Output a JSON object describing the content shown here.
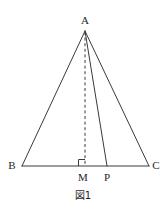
{
  "figure": {
    "caption": "図1",
    "background_color": "#ffffff",
    "stroke_color": "#3a3a3a",
    "label_color": "#1f1f1f",
    "width": 166,
    "height": 208,
    "points": {
      "A": {
        "label": "A",
        "x": 85,
        "y": 31,
        "label_x": 85,
        "label_y": 20
      },
      "B": {
        "label": "B",
        "x": 22,
        "y": 166,
        "label_x": 12,
        "label_y": 165
      },
      "C": {
        "label": "C",
        "x": 149,
        "y": 166,
        "label_x": 156,
        "label_y": 165
      },
      "M": {
        "label": "M",
        "x": 85,
        "y": 166,
        "label_x": 83,
        "label_y": 177
      },
      "P": {
        "label": "P",
        "x": 107,
        "y": 166,
        "label_x": 107,
        "label_y": 177
      }
    },
    "segments": [
      {
        "name": "side-AB",
        "from": "A",
        "to": "B",
        "style": "solid"
      },
      {
        "name": "side-AC",
        "from": "A",
        "to": "C",
        "style": "solid"
      },
      {
        "name": "base-BC",
        "from": "B",
        "to": "C",
        "style": "solid"
      },
      {
        "name": "cevian-AP",
        "from": "A",
        "to": "P",
        "style": "solid"
      },
      {
        "name": "altitude-AM",
        "from": "A",
        "to": "M",
        "style": "dashed"
      }
    ],
    "right_angle": {
      "at": "M",
      "size": 6,
      "side": "left"
    }
  }
}
